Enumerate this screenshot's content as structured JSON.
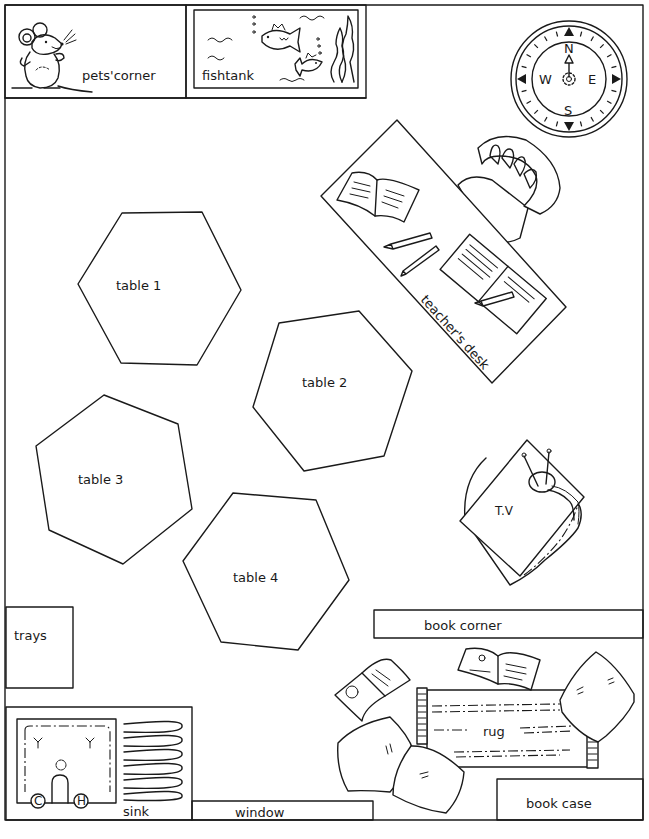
{
  "colors": {
    "line": "#1a1a1a",
    "background": "#ffffff"
  },
  "areas": {
    "pets_corner": {
      "label": "pets'corner",
      "icon": "mouse-icon"
    },
    "fishtank": {
      "label": "fishtank",
      "icon": "fish-icon"
    },
    "compass": {
      "north": "N",
      "south": "S",
      "east": "E",
      "west": "W"
    },
    "teachers_desk": {
      "label": "teacher's desk"
    },
    "tables": [
      {
        "label": "table 1"
      },
      {
        "label": "table 2"
      },
      {
        "label": "table 3"
      },
      {
        "label": "table 4"
      }
    ],
    "tv": {
      "label": "T.V"
    },
    "trays": {
      "label": "trays"
    },
    "book_corner": {
      "label": "book corner"
    },
    "rug": {
      "label": "rug"
    },
    "sink": {
      "label": "sink",
      "tap_cold": "C",
      "tap_hot": "H"
    },
    "window": {
      "label": "window"
    },
    "book_case": {
      "label": "book case"
    }
  }
}
